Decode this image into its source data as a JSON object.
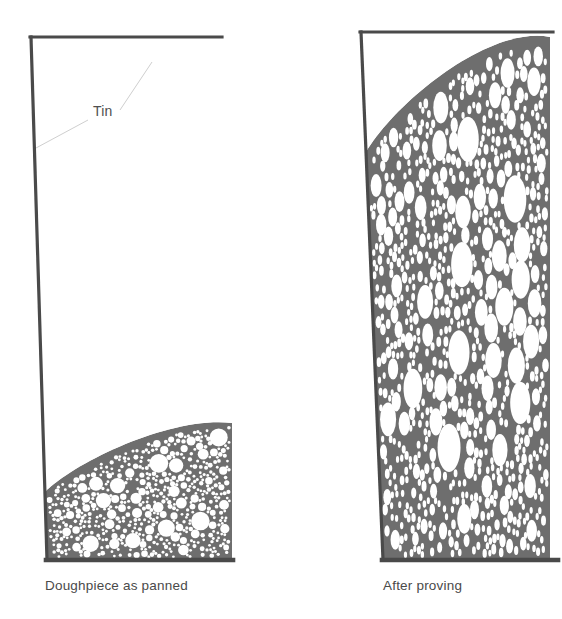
{
  "figure": {
    "background_color": "#ffffff",
    "panels": [
      {
        "id": "panel-before",
        "caption": "Doughpiece as panned",
        "caption_x": 45,
        "caption_y": 590,
        "annotation": {
          "label": "Tin",
          "label_x": 93,
          "label_y": 116,
          "leader_color": "#cfcfcf"
        },
        "tin": {
          "stroke_color": "#4a4a4a",
          "stroke_width": 3.2,
          "top_y": 37,
          "top_x1": 30,
          "top_x2": 222,
          "left_top_x": 31,
          "left_bottom_x": 47,
          "bottom_y": 560,
          "bottom_x1": 46,
          "bottom_x2": 233,
          "right_x": 232
        },
        "dough": {
          "fill_color": "#6e6e6e",
          "bubble_color": "#ffffff",
          "fill_fraction_percent": 25,
          "surface_left_y": 492,
          "surface_right_y": 423,
          "bubble_shape": "circle",
          "bubble_count": 520,
          "bubble_min_radius": 1.4,
          "bubble_max_radius": 9.5
        }
      },
      {
        "id": "panel-after",
        "caption": "After proving",
        "caption_x": 383,
        "caption_y": 590,
        "tin": {
          "stroke_color": "#4a4a4a",
          "stroke_width": 3.2,
          "top_y": 32,
          "top_x1": 360,
          "top_x2": 553,
          "left_top_x": 361,
          "left_bottom_x": 383,
          "bottom_y": 560,
          "bottom_x1": 382,
          "bottom_x2": 558,
          "right_x": 550
        },
        "dough": {
          "fill_color": "#6e6e6e",
          "bubble_color": "#ffffff",
          "fill_fraction_percent": 97,
          "surface_left_y": 152,
          "surface_right_y": 37,
          "bubble_shape": "vertical-ellipse",
          "bubble_count": 760,
          "bubble_min_radius": 1.6,
          "bubble_max_radius": 11.5,
          "bubble_aspect_ratio": 2.1
        }
      }
    ]
  }
}
